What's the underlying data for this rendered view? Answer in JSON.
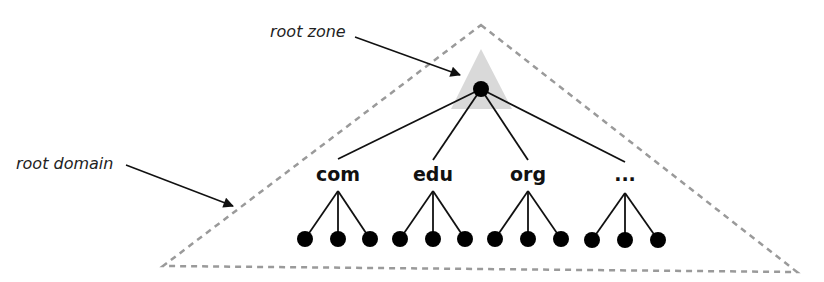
{
  "diagram": {
    "annotations": {
      "root_zone": "root zone",
      "root_domain": "root domain"
    },
    "colors": {
      "dashed_outline": "#9a9a9a",
      "zone_fill": "#d9d9d9",
      "node": "#000000",
      "edge": "#111111"
    },
    "root": {
      "label": ""
    },
    "children": [
      {
        "label": "com",
        "leaves": 3
      },
      {
        "label": "edu",
        "leaves": 3
      },
      {
        "label": "org",
        "leaves": 3
      },
      {
        "label": "...",
        "leaves": 3
      }
    ]
  }
}
